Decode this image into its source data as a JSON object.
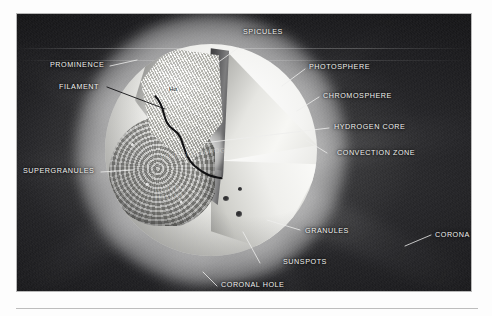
{
  "figure": {
    "alt_title": "Cutaway diagram of the Sun showing interior and atmospheric layers",
    "inline_symbol": "Hα"
  },
  "labels": {
    "spicules": "SPICULES",
    "prominence": "PROMINENCE",
    "filament": "FILAMENT",
    "photosphere": "PHOTOSPHERE",
    "chromosphere": "CHROMOSPHERE",
    "hydrogen_core": "HYDROGEN CORE",
    "convection_zone": "CONVECTION ZONE",
    "supergranules": "SUPERGRANULES",
    "granules": "GRANULES",
    "sunspots": "SUNSPOTS",
    "coronal_hole": "CORONAL HOLE",
    "corona": "CORONA",
    "ionized_helium": "IONIZED HELIUM",
    "ionized_hydrogen": "IONIZED HYDROGEN",
    "h_alpha": "Hα"
  },
  "colors": {
    "plate_background": "#141416",
    "label_text": "#f2f2f0",
    "leader_line": "#e8e8e6",
    "dark_leader_line": "#141416",
    "page_background": "#ffffff",
    "rule": "#bdbdbd",
    "sun_surface": "#f4f4f2",
    "core_glow": "#ffffff"
  }
}
